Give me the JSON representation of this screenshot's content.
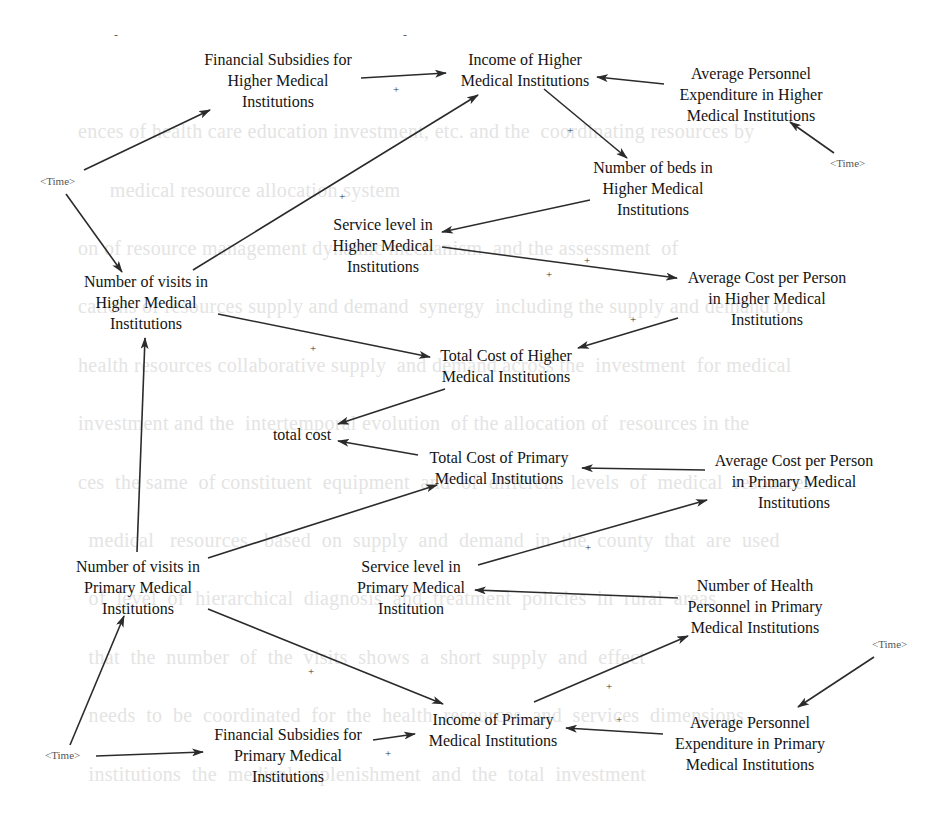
{
  "diagram": {
    "type": "causal-loop-diagram",
    "nodes": [
      {
        "id": "fin_sub_higher",
        "lines": [
          "Financial Subsidies for",
          "Higher Medical",
          "Institutions"
        ]
      },
      {
        "id": "income_higher",
        "lines": [
          "Income of Higher",
          "Medical Institutions"
        ]
      },
      {
        "id": "avg_pers_exp_higher",
        "lines": [
          "Average Personnel",
          "Expenditure in Higher",
          "Medical Institutions"
        ]
      },
      {
        "id": "beds_higher",
        "lines": [
          "Number of beds in",
          "Higher Medical",
          "Institutions"
        ]
      },
      {
        "id": "service_higher",
        "lines": [
          "Service level in",
          "Higher Medical",
          "Institutions"
        ]
      },
      {
        "id": "visits_higher",
        "lines": [
          "Number of visits in",
          "Higher Medical",
          "Institutions"
        ]
      },
      {
        "id": "avg_cost_higher",
        "lines": [
          "Average Cost per Person",
          "in Higher Medical",
          "Institutions"
        ]
      },
      {
        "id": "total_cost_higher",
        "lines": [
          "Total Cost of Higher",
          "Medical Institutions"
        ]
      },
      {
        "id": "total_cost",
        "lines": [
          "total cost"
        ]
      },
      {
        "id": "total_cost_primary",
        "lines": [
          "Total Cost of Primary",
          "Medical Institutions"
        ]
      },
      {
        "id": "avg_cost_primary",
        "lines": [
          "Average Cost per Person",
          "in Primary Medical",
          "Institutions"
        ]
      },
      {
        "id": "visits_primary",
        "lines": [
          "Number of visits in",
          "Primary Medical",
          "Institutions"
        ]
      },
      {
        "id": "service_primary",
        "lines": [
          "Service level in",
          "Primary Medical",
          "Institution"
        ]
      },
      {
        "id": "health_pers_primary",
        "lines": [
          "Number of Health",
          "Personnel in Primary",
          "Medical Institutions"
        ]
      },
      {
        "id": "income_primary",
        "lines": [
          "Income of Primary",
          "Medical Institutions"
        ]
      },
      {
        "id": "fin_sub_primary",
        "lines": [
          "Financial Subsidies for",
          "Primary Medical",
          "Institutions"
        ]
      },
      {
        "id": "avg_pers_exp_primary",
        "lines": [
          "Average Personnel",
          "Expenditure in Primary",
          "Medical Institutions"
        ]
      }
    ],
    "shadow_variables": [
      {
        "id": "time_1",
        "label": "<Time>"
      },
      {
        "id": "time_2",
        "label": "<Time>"
      },
      {
        "id": "time_3",
        "label": "<Time>"
      },
      {
        "id": "time_4",
        "label": "<Time>"
      }
    ],
    "polarity_marks": [
      "+",
      "+",
      "+",
      "+",
      "+",
      "+",
      "+",
      "+",
      "+",
      "+",
      "+",
      "+",
      "+"
    ],
    "dash_marks": [
      "-",
      "-"
    ],
    "links": [
      {
        "from": "time_1",
        "to": "fin_sub_higher"
      },
      {
        "from": "time_1",
        "to": "visits_higher"
      },
      {
        "from": "fin_sub_higher",
        "to": "income_higher",
        "polarity": "+"
      },
      {
        "from": "avg_pers_exp_higher",
        "to": "income_higher"
      },
      {
        "from": "time_2",
        "to": "avg_pers_exp_higher"
      },
      {
        "from": "visits_higher",
        "to": "income_higher",
        "polarity": "+"
      },
      {
        "from": "income_higher",
        "to": "beds_higher",
        "polarity": "+"
      },
      {
        "from": "beds_higher",
        "to": "service_higher"
      },
      {
        "from": "service_higher",
        "to": "avg_cost_higher",
        "polarity": "+"
      },
      {
        "from": "visits_higher",
        "to": "total_cost_higher",
        "polarity": "+"
      },
      {
        "from": "avg_cost_higher",
        "to": "total_cost_higher",
        "polarity": "+"
      },
      {
        "from": "total_cost_higher",
        "to": "total_cost"
      },
      {
        "from": "total_cost_primary",
        "to": "total_cost"
      },
      {
        "from": "avg_cost_primary",
        "to": "total_cost_primary"
      },
      {
        "from": "visits_primary",
        "to": "total_cost_primary"
      },
      {
        "from": "visits_primary",
        "to": "visits_higher"
      },
      {
        "from": "service_primary",
        "to": "avg_cost_primary",
        "polarity": "+"
      },
      {
        "from": "health_pers_primary",
        "to": "service_primary"
      },
      {
        "from": "income_primary",
        "to": "health_pers_primary",
        "polarity": "+"
      },
      {
        "from": "avg_pers_exp_primary",
        "to": "income_primary",
        "polarity": "+"
      },
      {
        "from": "time_4",
        "to": "avg_pers_exp_primary"
      },
      {
        "from": "visits_primary",
        "to": "income_primary",
        "polarity": "+"
      },
      {
        "from": "fin_sub_primary",
        "to": "income_primary",
        "polarity": "+"
      },
      {
        "from": "time_3",
        "to": "fin_sub_primary"
      },
      {
        "from": "time_3",
        "to": "visits_primary"
      }
    ]
  },
  "colors": {
    "node_text": "#141414",
    "arrow": "#2b2b2b",
    "shadow_text": "#555555",
    "background": "#ffffff",
    "bleed_through_text": "#e4e4e4"
  }
}
